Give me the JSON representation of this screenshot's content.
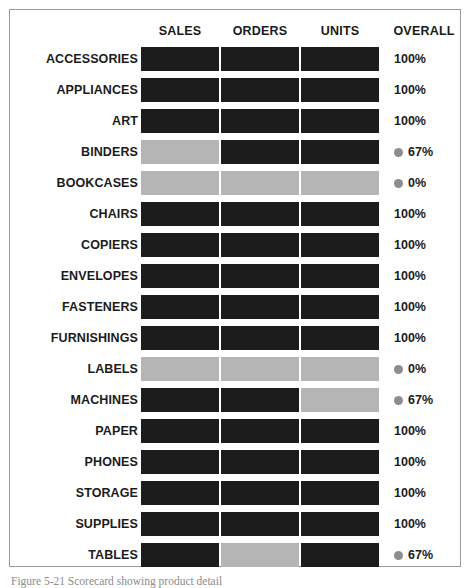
{
  "figure": {
    "caption": "Figure 5-21 Scorecard showing product detail"
  },
  "columns": {
    "label_header": "",
    "sales": "SALES",
    "orders": "ORDERS",
    "units": "UNITS",
    "overall": "OVERALL"
  },
  "legend": {
    "dot_color": "#8d8d8d",
    "pass_color": "#1c1c1c",
    "fail_color": "#b5b5b5"
  },
  "chart_data": {
    "type": "heatmap",
    "title": "",
    "subtitle": "",
    "xlabel": "",
    "ylabel": "",
    "grid": false,
    "legend_position": "none",
    "categories": [
      "SALES",
      "ORDERS",
      "UNITS"
    ],
    "overall_column": "OVERALL",
    "value_map": {
      "dark": "pass",
      "light": "fail"
    },
    "rows": [
      {
        "label": "ACCESSORIES",
        "cells": [
          "dark",
          "dark",
          "dark"
        ],
        "overall": "100%",
        "flagged": false
      },
      {
        "label": "APPLIANCES",
        "cells": [
          "dark",
          "dark",
          "dark"
        ],
        "overall": "100%",
        "flagged": false
      },
      {
        "label": "ART",
        "cells": [
          "dark",
          "dark",
          "dark"
        ],
        "overall": "100%",
        "flagged": false
      },
      {
        "label": "BINDERS",
        "cells": [
          "light",
          "dark",
          "dark"
        ],
        "overall": "67%",
        "flagged": true
      },
      {
        "label": "BOOKCASES",
        "cells": [
          "light",
          "light",
          "light"
        ],
        "overall": "0%",
        "flagged": true
      },
      {
        "label": "CHAIRS",
        "cells": [
          "dark",
          "dark",
          "dark"
        ],
        "overall": "100%",
        "flagged": false
      },
      {
        "label": "COPIERS",
        "cells": [
          "dark",
          "dark",
          "dark"
        ],
        "overall": "100%",
        "flagged": false
      },
      {
        "label": "ENVELOPES",
        "cells": [
          "dark",
          "dark",
          "dark"
        ],
        "overall": "100%",
        "flagged": false
      },
      {
        "label": "FASTENERS",
        "cells": [
          "dark",
          "dark",
          "dark"
        ],
        "overall": "100%",
        "flagged": false
      },
      {
        "label": "FURNISHINGS",
        "cells": [
          "dark",
          "dark",
          "dark"
        ],
        "overall": "100%",
        "flagged": false
      },
      {
        "label": "LABELS",
        "cells": [
          "light",
          "light",
          "light"
        ],
        "overall": "0%",
        "flagged": true
      },
      {
        "label": "MACHINES",
        "cells": [
          "dark",
          "dark",
          "light"
        ],
        "overall": "67%",
        "flagged": true
      },
      {
        "label": "PAPER",
        "cells": [
          "dark",
          "dark",
          "dark"
        ],
        "overall": "100%",
        "flagged": false
      },
      {
        "label": "PHONES",
        "cells": [
          "dark",
          "dark",
          "dark"
        ],
        "overall": "100%",
        "flagged": false
      },
      {
        "label": "STORAGE",
        "cells": [
          "dark",
          "dark",
          "dark"
        ],
        "overall": "100%",
        "flagged": false
      },
      {
        "label": "SUPPLIES",
        "cells": [
          "dark",
          "dark",
          "dark"
        ],
        "overall": "100%",
        "flagged": false
      },
      {
        "label": "TABLES",
        "cells": [
          "dark",
          "light",
          "dark"
        ],
        "overall": "67%",
        "flagged": true
      }
    ]
  }
}
